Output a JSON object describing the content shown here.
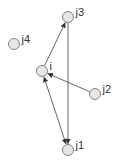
{
  "diagram": {
    "type": "directed-graph",
    "nodes": [
      {
        "id": "j3",
        "label": "j3",
        "x": 68,
        "y": 17
      },
      {
        "id": "j4",
        "label": "j4",
        "x": 14,
        "y": 44
      },
      {
        "id": "i",
        "label": "i",
        "x": 42,
        "y": 71
      },
      {
        "id": "j2",
        "label": "j2",
        "x": 95,
        "y": 94
      },
      {
        "id": "j1",
        "label": "j1",
        "x": 68,
        "y": 150
      }
    ],
    "edges": [
      {
        "from": "i",
        "to": "j3",
        "direction": "forward"
      },
      {
        "from": "j2",
        "to": "i",
        "direction": "forward"
      },
      {
        "from": "j3",
        "to": "j1",
        "direction": "forward"
      },
      {
        "from": "i",
        "to": "j1",
        "direction": "both"
      }
    ],
    "style": {
      "node_radius": 5.5,
      "node_fill": "#e6e6e6",
      "node_stroke": "#777777",
      "edge_color": "#555555",
      "label_color": "#333333"
    }
  }
}
